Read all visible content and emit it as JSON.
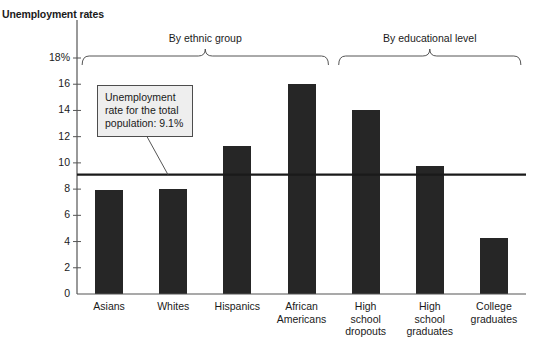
{
  "chart_data": {
    "type": "bar",
    "title": "",
    "ylabel": "Unemployment rates",
    "xlabel": "",
    "ylim": [
      0,
      18
    ],
    "ytick_values": [
      0,
      2,
      4,
      6,
      8,
      10,
      12,
      14,
      16,
      18
    ],
    "ytick_labels": [
      "0",
      "2",
      "4",
      "6",
      "8",
      "10",
      "12",
      "14",
      "16",
      "18%"
    ],
    "grid": false,
    "legend": "none",
    "categories": [
      "Asians",
      "Whites",
      "Hispanics",
      "African Americans",
      "High school dropouts",
      "High school graduates",
      "College graduates"
    ],
    "category_lines": [
      [
        "Asians"
      ],
      [
        "Whites"
      ],
      [
        "Hispanics"
      ],
      [
        "African",
        "Americans"
      ],
      [
        "High",
        "school",
        "dropouts"
      ],
      [
        "High",
        "school",
        "graduates"
      ],
      [
        "College",
        "graduates"
      ]
    ],
    "values": [
      7.9,
      8.0,
      11.3,
      16.0,
      14.0,
      9.8,
      4.3
    ],
    "bar_color": "#262626",
    "reference_line": {
      "value": 9.1,
      "label": "Unemployment rate for the total population: 9.1%"
    },
    "group_brackets": [
      {
        "label": "By ethnic group",
        "categories": [
          "Asians",
          "Whites",
          "Hispanics",
          "African Americans"
        ]
      },
      {
        "label": "By educational level",
        "categories": [
          "High school dropouts",
          "High school graduates",
          "College graduates"
        ]
      }
    ]
  },
  "annotations": {
    "callout_text": "Unemployment rate for the total population: 9.1%"
  }
}
